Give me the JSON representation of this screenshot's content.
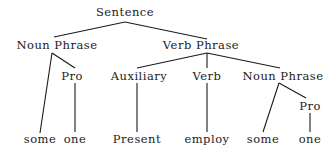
{
  "diagram": {
    "type": "syntax-tree",
    "nodes": {
      "root": "Sentence",
      "np1": "Noun Phrase",
      "vp": "Verb Phrase",
      "np1_pro": "Pro",
      "aux": "Auxiliary",
      "verb": "Verb",
      "np2": "Noun Phrase",
      "np2_pro": "Pro",
      "leaf_some1": "some",
      "leaf_one1": "one",
      "leaf_present": "Present",
      "leaf_employ": "employ",
      "leaf_some2": "some",
      "leaf_one2": "one"
    },
    "edges": [
      [
        "Sentence",
        "Noun Phrase"
      ],
      [
        "Sentence",
        "Verb Phrase"
      ],
      [
        "Noun Phrase",
        "some"
      ],
      [
        "Noun Phrase",
        "Pro"
      ],
      [
        "Pro",
        "one"
      ],
      [
        "Verb Phrase",
        "Auxiliary"
      ],
      [
        "Verb Phrase",
        "Verb"
      ],
      [
        "Verb Phrase",
        "Noun Phrase"
      ],
      [
        "Auxiliary",
        "Present"
      ],
      [
        "Verb",
        "employ"
      ],
      [
        "Noun Phrase",
        "some"
      ],
      [
        "Noun Phrase",
        "Pro"
      ],
      [
        "Pro",
        "one"
      ]
    ],
    "colors": {
      "ink": "#222222",
      "background": "#ffffff"
    }
  }
}
